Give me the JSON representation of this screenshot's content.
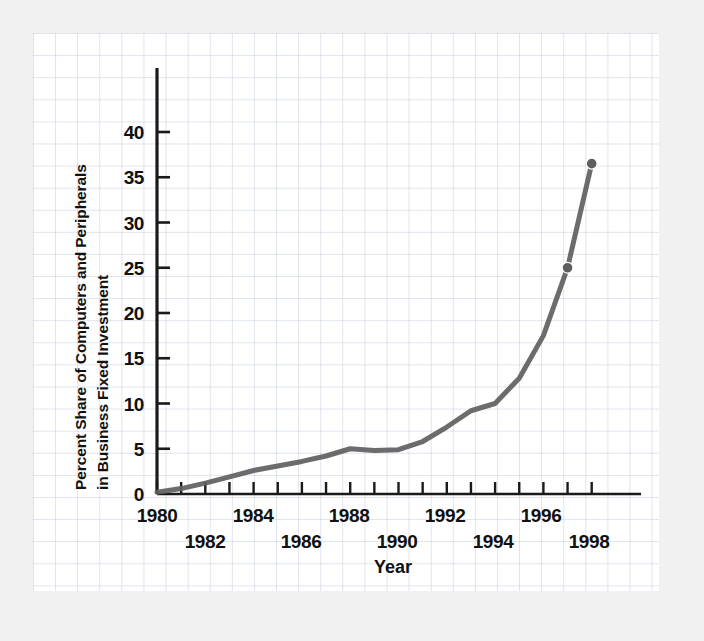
{
  "chart_data": {
    "type": "line",
    "title": "",
    "xlabel": "Year",
    "ylabel": "Percent Share of Computers and Peripherals in Business Fixed Investment",
    "ylabel_line1": "Percent Share of Computers and Peripherals",
    "ylabel_line2": "in Business Fixed Investment",
    "grid": true,
    "legend": "none",
    "line_color": "#5f5f5f",
    "marker_color": "#5f5f5f",
    "axis_color": "#1a1a1a",
    "background_color": "#ffffff",
    "page_background": "#f1f1f1",
    "grid_color": "#96a5c3",
    "xlim": [
      1980,
      1999
    ],
    "ylim": [
      0,
      45
    ],
    "yticks": [
      0,
      5,
      10,
      15,
      20,
      25,
      30,
      35,
      40
    ],
    "ytick_labels": [
      "0",
      "5",
      "10",
      "15",
      "20",
      "25",
      "30",
      "35",
      "40"
    ],
    "xticks": [
      1980,
      1981,
      1982,
      1983,
      1984,
      1985,
      1986,
      1987,
      1988,
      1989,
      1990,
      1991,
      1992,
      1993,
      1994,
      1995,
      1996,
      1997,
      1998
    ],
    "xtick_labels_row1": [
      "1980",
      "1984",
      "1988",
      "1992",
      "1996"
    ],
    "xtick_labels_row2": [
      "1982",
      "1986",
      "1990",
      "1994",
      "1998"
    ],
    "xtick_label_years_row1": [
      1980,
      1984,
      1988,
      1992,
      1996
    ],
    "xtick_label_years_row2": [
      1982,
      1986,
      1990,
      1994,
      1998
    ],
    "x": [
      1980,
      1981,
      1982,
      1983,
      1984,
      1985,
      1986,
      1987,
      1988,
      1989,
      1990,
      1991,
      1992,
      1993,
      1994,
      1995,
      1996,
      1997,
      1998
    ],
    "values": [
      0.2,
      0.6,
      1.2,
      1.9,
      2.6,
      3.1,
      3.6,
      4.2,
      5.0,
      4.8,
      4.9,
      5.8,
      7.4,
      9.2,
      10.0,
      12.8,
      17.5,
      25.0,
      36.5
    ],
    "markers_shown_at_x": [
      1997,
      1998
    ],
    "markers_shown_values": [
      25.0,
      36.5
    ]
  },
  "ytick_labels": [
    "40",
    "35",
    "30",
    "25",
    "20",
    "15",
    "10",
    "5",
    "0"
  ],
  "axis": {
    "ylabel_line1": "Percent Share of Computers and Peripherals",
    "ylabel_line2": "in Business Fixed Investment",
    "xtitle": "Year"
  },
  "xtick_row1": [
    "1980",
    "1984",
    "1988",
    "1992",
    "1996"
  ],
  "xtick_row2": [
    "1982",
    "1986",
    "1990",
    "1994",
    "1998"
  ]
}
